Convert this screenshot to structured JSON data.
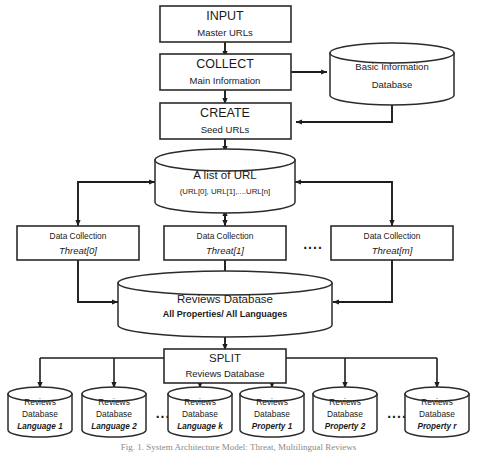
{
  "figure": {
    "caption": "Fig. 1.  System Architecture Model: Threat, Multilingual Reviews"
  },
  "nodes": {
    "input": {
      "title": "INPUT",
      "subtitle": "Master URLs"
    },
    "collect": {
      "title": "COLLECT",
      "subtitle": "Main Information"
    },
    "basic_db": {
      "line1": "Basic Information",
      "line2": "Database"
    },
    "create": {
      "title": "CREATE",
      "subtitle": "Seed URLs"
    },
    "url_list": {
      "title": "A list of URL",
      "subtitle": "(URL[0], URL[1],....URL[n]"
    },
    "data_collection": [
      {
        "title": "Data Collection",
        "subtitle": "Threat[0]"
      },
      {
        "title": "Data Collection",
        "subtitle": "Threat[1]"
      },
      {
        "title": "Data Collection",
        "subtitle": "Threat[m]"
      }
    ],
    "reviews_db": {
      "title": "Reviews Database",
      "subtitle": "All Properties/ All Languages"
    },
    "split": {
      "title": "SPLIT",
      "subtitle": "Reviews Database"
    },
    "output_dbs": [
      {
        "line1": "Reviews",
        "line2": "Database",
        "line3": "Language 1"
      },
      {
        "line1": "Reviews",
        "line2": "Database",
        "line3": "Language 2"
      },
      {
        "line1": "Reviews",
        "line2": "Database",
        "line3": "Language k"
      },
      {
        "line1": "Reviews",
        "line2": "Database",
        "line3": "Property 1"
      },
      {
        "line1": "Reviews",
        "line2": "Database",
        "line3": "Property 2"
      },
      {
        "line1": "Reviews",
        "line2": "Database",
        "line3": "Property r"
      }
    ]
  },
  "ellipses": {
    "middle_row": "....",
    "bottom_left": "...",
    "bottom_right": "...."
  },
  "colors": {
    "stroke": "#2b2b2b",
    "arrow": "#1d1d1d",
    "fill": "#ffffff",
    "text": "#1a1a1a"
  }
}
